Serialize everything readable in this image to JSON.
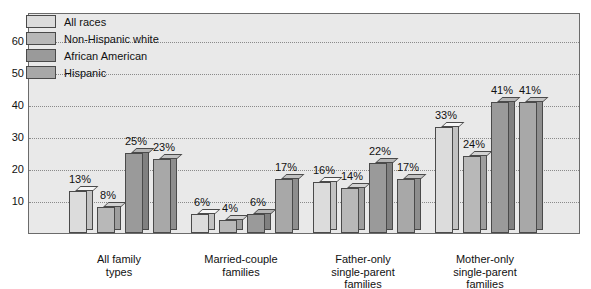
{
  "chart_data": {
    "type": "bar",
    "title": "",
    "xlabel": "",
    "ylabel": "",
    "ylim": [
      0,
      65
    ],
    "grid": true,
    "legend_position": "top-left",
    "y_ticks": [
      "10",
      "20",
      "30",
      "40",
      "50",
      "60"
    ],
    "categories": [
      "All family\ntypes",
      "Married-couple\nfamilies",
      "Father-only\nsingle-parent\nfamilies",
      "Mother-only\nsingle-parent\nfamilies"
    ],
    "category_lines": [
      [
        "All family",
        "types"
      ],
      [
        "Married-couple",
        "families"
      ],
      [
        "Father-only",
        "single-parent",
        "families"
      ],
      [
        "Mother-only",
        "single-parent",
        "families"
      ]
    ],
    "series": [
      {
        "name": "All races",
        "color": "#dcdcdc",
        "values": [
          13,
          6,
          16,
          33
        ],
        "labels": [
          "13%",
          "6%",
          "16%",
          "33%"
        ]
      },
      {
        "name": "Non-Hispanic white",
        "color": "#b8b8b8",
        "values": [
          8,
          4,
          14,
          24
        ],
        "labels": [
          "8%",
          "4%",
          "14%",
          "24%"
        ]
      },
      {
        "name": "African American",
        "color": "#9a9a9a",
        "values": [
          25,
          6,
          22,
          41
        ],
        "labels": [
          "25%",
          "6%",
          "22%",
          "41%"
        ]
      },
      {
        "name": "Hispanic",
        "color": "#a8a8a8",
        "values": [
          23,
          17,
          17,
          41
        ],
        "labels": [
          "23%",
          "17%",
          "17%",
          "41%"
        ]
      }
    ]
  },
  "colors": {
    "plot_background": "#e9e9e9",
    "frame_border": "#6b6b6b",
    "gridline": "#8a8a8a",
    "bar_outline": "#4a4a4a",
    "text": "#111111",
    "page_background": "#ffffff"
  }
}
